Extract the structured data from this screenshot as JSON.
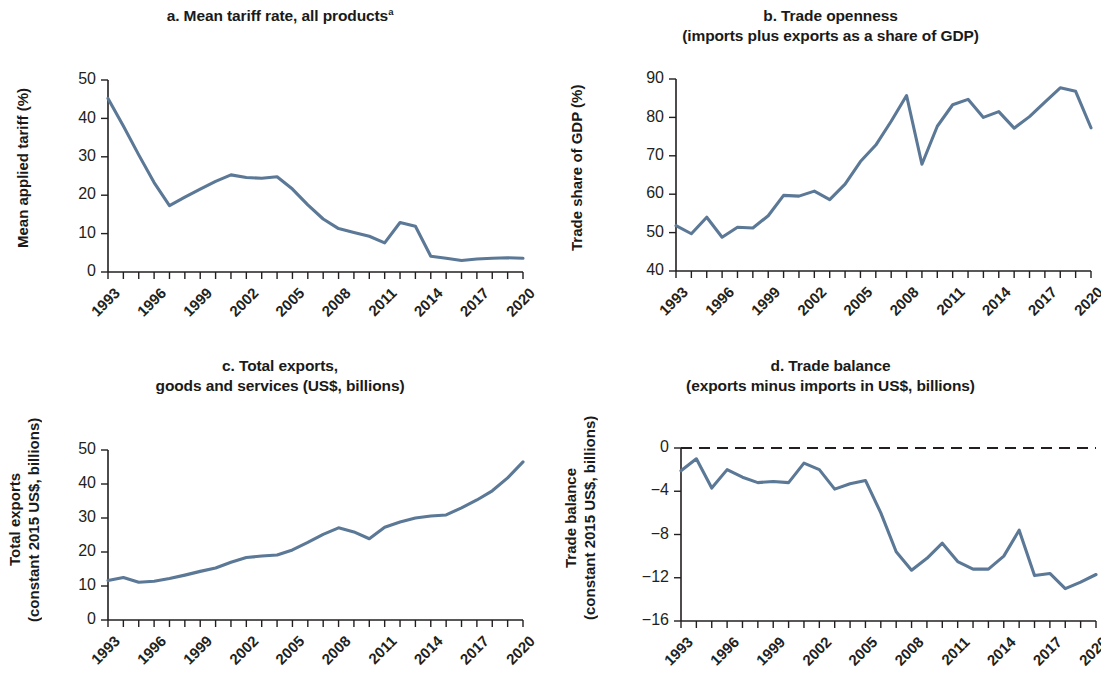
{
  "figure": {
    "line_color": "#5b7896",
    "axis_color": "#231f20",
    "background": "#ffffff"
  },
  "panels": {
    "a": {
      "title_line1": "a. Mean tariff rate, all products",
      "title_superscript": "a",
      "title_line2": "",
      "ylabel_line1": "Mean applied tariff (%)",
      "ylabel_line2": ""
    },
    "b": {
      "title_line1": "b. Trade openness",
      "title_superscript": "",
      "title_line2": "(imports plus exports as a share of GDP)",
      "ylabel_line1": "Trade share of GDP (%)",
      "ylabel_line2": ""
    },
    "c": {
      "title_line1": "c. Total exports,",
      "title_superscript": "",
      "title_line2": "goods and services (US$, billions)",
      "ylabel_line1": "Total exports",
      "ylabel_line2": "(constant 2015 US$, billions)"
    },
    "d": {
      "title_line1": "d. Trade balance",
      "title_superscript": "",
      "title_line2": "(exports minus imports in US$, billions)",
      "ylabel_line1": "Trade balance",
      "ylabel_line2": "(constant 2015 US$, billions)"
    }
  },
  "chart_data": [
    {
      "id": "a",
      "type": "line",
      "title": "a. Mean tariff rate, all products",
      "xlabel": "",
      "ylabel": "Mean applied tariff (%)",
      "ylim": [
        0,
        50
      ],
      "yticks": [
        0,
        10,
        20,
        30,
        40,
        50
      ],
      "ytick_labels": [
        "0",
        "10",
        "20",
        "30",
        "40",
        "50"
      ],
      "xticks": [
        1993,
        1996,
        1999,
        2002,
        2005,
        2008,
        2011,
        2014,
        2017,
        2020
      ],
      "xtick_labels": [
        "1993",
        "1996",
        "1999",
        "2002",
        "2005",
        "2008",
        "2011",
        "2014",
        "2017",
        "2020"
      ],
      "xlim": [
        1993,
        2020
      ],
      "grid": false,
      "legend": null,
      "x": [
        1993,
        1994,
        1995,
        1996,
        1997,
        1998,
        1999,
        2000,
        2001,
        2002,
        2003,
        2004,
        2005,
        2006,
        2007,
        2008,
        2009,
        2010,
        2011,
        2012,
        2013,
        2014,
        2015,
        2016,
        2017,
        2018,
        2019,
        2020
      ],
      "values": [
        45.2,
        38.0,
        30.5,
        23.3,
        17.3,
        19.5,
        21.6,
        23.6,
        25.3,
        24.6,
        24.4,
        24.8,
        21.6,
        17.5,
        13.8,
        11.3,
        10.3,
        9.3,
        7.6,
        12.9,
        11.9,
        4.1,
        3.6,
        3.0,
        3.4,
        3.6,
        3.7,
        3.6
      ]
    },
    {
      "id": "b",
      "type": "line",
      "title": "b. Trade openness (imports plus exports as a share of GDP)",
      "xlabel": "",
      "ylabel": "Trade share of GDP (%)",
      "ylim": [
        40,
        90
      ],
      "yticks": [
        40,
        50,
        60,
        70,
        80,
        90
      ],
      "ytick_labels": [
        "40",
        "50",
        "60",
        "70",
        "80",
        "90"
      ],
      "xticks": [
        1993,
        1996,
        1999,
        2002,
        2005,
        2008,
        2011,
        2014,
        2017,
        2020
      ],
      "xtick_labels": [
        "1993",
        "1996",
        "1999",
        "2002",
        "2005",
        "2008",
        "2011",
        "2014",
        "2017",
        "2020"
      ],
      "xlim": [
        1993,
        2020
      ],
      "grid": false,
      "legend": null,
      "x": [
        1993,
        1994,
        1995,
        1996,
        1997,
        1998,
        1999,
        2000,
        2001,
        2002,
        2003,
        2004,
        2005,
        2006,
        2007,
        2008,
        2009,
        2010,
        2011,
        2012,
        2013,
        2014,
        2015,
        2016,
        2017,
        2018,
        2019,
        2020
      ],
      "values": [
        51.8,
        49.7,
        54.0,
        48.8,
        51.4,
        51.2,
        54.4,
        59.7,
        59.5,
        60.8,
        58.6,
        62.6,
        68.5,
        72.8,
        79.0,
        85.7,
        67.8,
        77.7,
        83.3,
        84.7,
        80.0,
        81.5,
        77.2,
        80.2,
        84.0,
        87.7,
        86.8,
        77.3
      ]
    },
    {
      "id": "c",
      "type": "line",
      "title": "c. Total exports, goods and services (US$, billions)",
      "xlabel": "",
      "ylabel": "Total exports (constant 2015 US$, billions)",
      "ylim": [
        0,
        50
      ],
      "yticks": [
        0,
        10,
        20,
        30,
        40,
        50
      ],
      "ytick_labels": [
        "0",
        "10",
        "20",
        "30",
        "40",
        "50"
      ],
      "xticks": [
        1993,
        1996,
        1999,
        2002,
        2005,
        2008,
        2011,
        2014,
        2017,
        2020
      ],
      "xtick_labels": [
        "1993",
        "1996",
        "1999",
        "2002",
        "2005",
        "2008",
        "2011",
        "2014",
        "2017",
        "2020"
      ],
      "xlim": [
        1993,
        2020
      ],
      "grid": false,
      "legend": null,
      "x": [
        1993,
        1994,
        1995,
        1996,
        1997,
        1998,
        1999,
        2000,
        2001,
        2002,
        2003,
        2004,
        2005,
        2006,
        2007,
        2008,
        2009,
        2010,
        2011,
        2012,
        2013,
        2014,
        2015,
        2016,
        2017,
        2018,
        2019,
        2020
      ],
      "values": [
        11.6,
        12.5,
        11.1,
        11.4,
        12.2,
        13.2,
        14.3,
        15.3,
        17.0,
        18.4,
        18.8,
        19.1,
        20.6,
        22.8,
        25.2,
        27.1,
        25.9,
        23.9,
        27.3,
        28.8,
        30.0,
        30.6,
        30.9,
        33.0,
        35.3,
        38.0,
        41.8,
        46.5,
        40.1
      ]
    },
    {
      "id": "d",
      "type": "line",
      "title": "d. Trade balance (exports minus imports in US$, billions)",
      "xlabel": "",
      "ylabel": "Trade balance (constant 2015 US$, billions)",
      "ylim": [
        -16,
        0
      ],
      "yticks": [
        -16,
        -12,
        -8,
        -4,
        0
      ],
      "ytick_labels": [
        "−16",
        "−12",
        "−8",
        "−4",
        "0"
      ],
      "xticks": [
        1993,
        1996,
        1999,
        2002,
        2005,
        2008,
        2011,
        2014,
        2017,
        2020
      ],
      "xtick_labels": [
        "1993",
        "1996",
        "1999",
        "2002",
        "2005",
        "2008",
        "2011",
        "2014",
        "2017",
        "2020"
      ],
      "xlim": [
        1993,
        2020
      ],
      "grid": false,
      "zero_reference_line": 0,
      "legend": null,
      "x": [
        1993,
        1994,
        1995,
        1996,
        1997,
        1998,
        1999,
        2000,
        2001,
        2002,
        2003,
        2004,
        2005,
        2006,
        2007,
        2008,
        2009,
        2010,
        2011,
        2012,
        2013,
        2014,
        2015,
        2016,
        2017,
        2018,
        2019,
        2020
      ],
      "values": [
        -2.1,
        -1.0,
        -3.7,
        -2.0,
        -2.7,
        -3.2,
        -3.1,
        -3.2,
        -1.4,
        -2.0,
        -3.8,
        -3.3,
        -3.0,
        -6.0,
        -9.6,
        -11.3,
        -10.2,
        -8.8,
        -10.5,
        -11.2,
        -11.2,
        -10.0,
        -7.6,
        -11.8,
        -11.6,
        -13.0,
        -12.4,
        -11.7
      ]
    }
  ]
}
